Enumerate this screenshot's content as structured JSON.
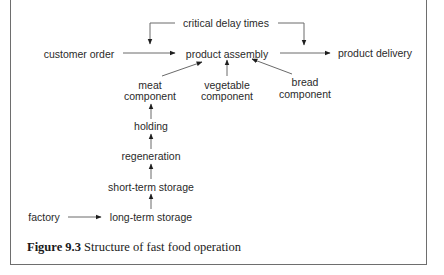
{
  "diagram": {
    "nodes": {
      "critical_delay_times": "critical delay times",
      "customer_order": "customer order",
      "product_assembly": "product assembly",
      "product_delivery": "product delivery",
      "meat_component_line1": "meat",
      "meat_component_line2": "component",
      "vegetable_component_line1": "vegetable",
      "vegetable_component_line2": "component",
      "bread_component_line1": "bread",
      "bread_component_line2": "component",
      "holding": "holding",
      "regeneration": "regeneration",
      "short_term_storage": "short-term storage",
      "long_term_storage": "long-term storage",
      "factory": "factory"
    },
    "edges": [
      {
        "from": "critical delay times",
        "to": "product assembly"
      },
      {
        "from": "critical delay times",
        "to": "product delivery"
      },
      {
        "from": "customer order",
        "to": "product assembly"
      },
      {
        "from": "product assembly",
        "to": "product delivery"
      },
      {
        "from": "meat component",
        "to": "product assembly"
      },
      {
        "from": "vegetable component",
        "to": "product assembly"
      },
      {
        "from": "bread component",
        "to": "product assembly"
      },
      {
        "from": "holding",
        "to": "meat component"
      },
      {
        "from": "regeneration",
        "to": "holding"
      },
      {
        "from": "short-term storage",
        "to": "regeneration"
      },
      {
        "from": "long-term storage",
        "to": "short-term storage"
      },
      {
        "from": "factory",
        "to": "long-term storage"
      }
    ]
  },
  "caption": {
    "label": "Figure 9.3",
    "text": " Structure of fast food operation"
  }
}
